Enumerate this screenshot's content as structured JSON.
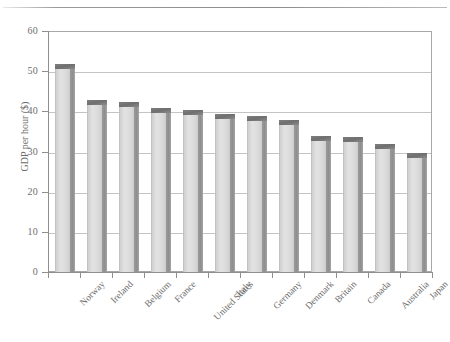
{
  "figure": {
    "clipped_fragment": "",
    "top_rule": "horizontal-rule"
  },
  "chart_data": {
    "type": "bar",
    "title": "",
    "subtitle": "",
    "xlabel": "",
    "ylabel": "GDP per hour ($)",
    "categories": [
      "Norway",
      "Ireland",
      "Belgium",
      "France",
      "United States",
      "Italy",
      "Germany",
      "Denmark",
      "Britain",
      "Canada",
      "Australia",
      "Japan"
    ],
    "values": [
      51,
      42,
      41.5,
      40,
      39.5,
      38.5,
      38,
      37,
      33,
      32.8,
      31,
      29
    ],
    "ylim": [
      0,
      60
    ],
    "ytick_labels": [
      "0",
      "10",
      "20",
      "30",
      "40",
      "50",
      "60"
    ],
    "ytick_values": [
      0,
      10,
      20,
      30,
      40,
      50,
      60
    ],
    "grid": true,
    "grid_axis": "y",
    "legend": "none",
    "bar_face_color": "#dcdcdc",
    "bar_side_color": "#8e8e8e",
    "bar_top_color": "#6f6f6f",
    "gridline_color": "#c4c4c4",
    "axis_color": "#8f8f8f",
    "text_color": "#6b6b6b",
    "background_color": "#ffffff"
  }
}
